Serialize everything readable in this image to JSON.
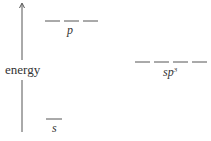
{
  "axis": {
    "label": "energy",
    "direction": "up"
  },
  "levels": [
    {
      "name": "p",
      "label": "p",
      "superscript": "",
      "degeneracy": 3,
      "y": 21,
      "x_start": 45,
      "segment_width": 15,
      "gap": 4
    },
    {
      "name": "sp3",
      "label": "sp",
      "superscript": "3",
      "degeneracy": 4,
      "y": 62,
      "x_start": 135,
      "segment_width": 15,
      "gap": 4
    },
    {
      "name": "s",
      "label": "s",
      "superscript": "",
      "degeneracy": 1,
      "y": 119,
      "x_start": 46,
      "segment_width": 16,
      "gap": 0
    }
  ],
  "colors": {
    "line": "#555555",
    "text": "#333333"
  }
}
